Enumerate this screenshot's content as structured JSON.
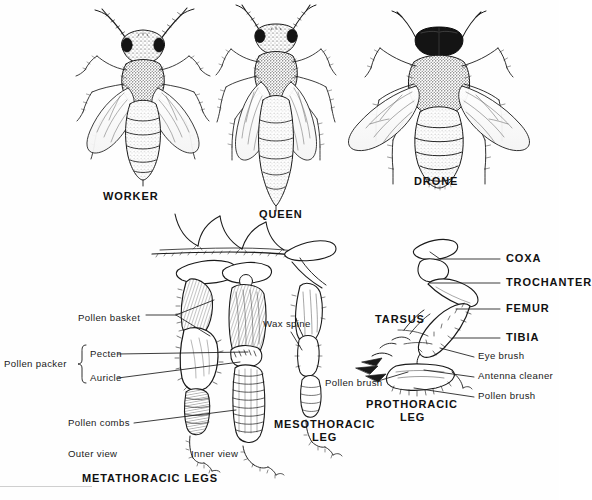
{
  "plate": {
    "title": "Honeybee castes and leg anatomy",
    "background_color": "#ffffff",
    "ink_color": "#111111"
  },
  "castes": [
    {
      "id": "worker",
      "label": "WORKER",
      "x": 103,
      "y": 196,
      "description": "Worker honeybee, dorsal view, banded tapered abdomen"
    },
    {
      "id": "queen",
      "label": "QUEEN",
      "x": 259,
      "y": 214,
      "description": "Queen honeybee, dorsal view, long pointed abdomen"
    },
    {
      "id": "drone",
      "label": "DRONE",
      "x": 414,
      "y": 181,
      "description": "Drone honeybee, dorsal view, large eyes and blunt abdomen"
    }
  ],
  "leg_diagram": {
    "bold_labels": [
      {
        "id": "coxa",
        "label": "COXA",
        "x": 506,
        "y": 254
      },
      {
        "id": "trochanter",
        "label": "TROCHANTER",
        "x": 506,
        "y": 282
      },
      {
        "id": "femur",
        "label": "FEMUR",
        "x": 506,
        "y": 308
      },
      {
        "id": "tibia",
        "label": "TIBIA",
        "x": 506,
        "y": 337
      },
      {
        "id": "tarsus",
        "label": "TARSUS",
        "x": 375,
        "y": 320
      }
    ],
    "thin_labels": [
      {
        "id": "pollen-basket",
        "label": "Pollen basket",
        "x": 78,
        "y": 318
      },
      {
        "id": "pollen-packer",
        "label": "Pollen packer",
        "x": 4,
        "y": 364
      },
      {
        "id": "pecten",
        "label": "Pecten",
        "x": 78,
        "y": 357
      },
      {
        "id": "auricle",
        "label": "Auricle",
        "x": 78,
        "y": 381
      },
      {
        "id": "pollen-combs",
        "label": "Pollen combs",
        "x": 70,
        "y": 426
      },
      {
        "id": "outer-view",
        "label": "Outer view",
        "x": 68,
        "y": 455
      },
      {
        "id": "inner-view",
        "label": "Inner view",
        "x": 191,
        "y": 455
      },
      {
        "id": "wax-spine",
        "label": "Wax spine",
        "x": 263,
        "y": 324
      },
      {
        "id": "pollen-brush-mid",
        "label": "Pollen brush",
        "x": 325,
        "y": 384
      },
      {
        "id": "eye-brush",
        "label": "Eye brush",
        "x": 478,
        "y": 357
      },
      {
        "id": "antenna-cleaner",
        "label": "Antenna cleaner",
        "x": 478,
        "y": 377
      },
      {
        "id": "pollen-brush-pro",
        "label": "Pollen brush",
        "x": 478,
        "y": 397
      }
    ],
    "leg_names": [
      {
        "id": "mesothoracic-leg",
        "line1": "MESOTHORACIC",
        "line2": "LEG",
        "x": 274,
        "y": 424
      },
      {
        "id": "prothoracic-leg",
        "line1": "PROTHORACIC",
        "line2": "LEG",
        "x": 366,
        "y": 404
      },
      {
        "id": "metathoracic-legs",
        "line1": "METATHORACIC LEGS",
        "line2": "",
        "x": 82,
        "y": 478
      }
    ]
  }
}
